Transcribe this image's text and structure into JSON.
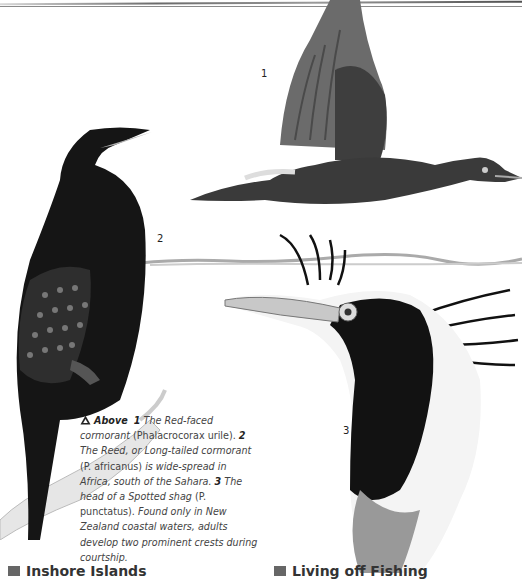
{
  "page": {
    "type": "illustrated book page"
  },
  "figures": [
    {
      "id": 1,
      "label": "1",
      "subject": "Red-faced cormorant in flight"
    },
    {
      "id": 2,
      "label": "2",
      "subject": "Reed, or Long-tailed cormorant perched on branch"
    },
    {
      "id": 3,
      "label": "3",
      "subject": "Head of a Spotted shag with crests"
    }
  ],
  "caption": {
    "icon": "up-triangle-icon",
    "lead": "Above",
    "n1": "1",
    "t1": "The Red-faced cormorant",
    "t1b": "(Phalacrocorax urile).",
    "n2": "2",
    "t2": "The Reed, or Long-tailed cormorant",
    "t2b": "(P. africanus)",
    "t2c": "is wide-spread in Africa, south of the Sahara.",
    "n3": "3",
    "t3": "The head of a Spotted shag",
    "t3b": "(P. punctatus).",
    "t3c": "Found only in New Zealand coastal waters, adults develop two prominent crests during courtship."
  },
  "headings": {
    "left": "Inshore Islands",
    "right": "Living off Fishing"
  },
  "colors": {
    "text": "#444444",
    "heading": "#333333",
    "marker": "#666666"
  }
}
